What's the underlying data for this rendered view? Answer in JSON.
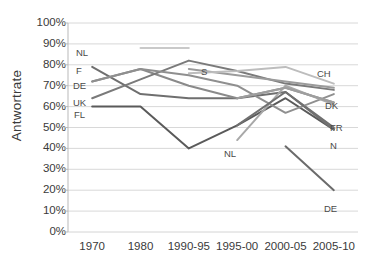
{
  "chart_data": {
    "type": "line",
    "title": "",
    "xlabel": "",
    "ylabel": "Antwortrate",
    "ylim": [
      0,
      100
    ],
    "grid": true,
    "legend": "inline-end-labels",
    "categories": [
      "1970",
      "1980",
      "1990-95",
      "1995-00",
      "2000-05",
      "2005-10"
    ],
    "ytick_labels": [
      "100%",
      "90%",
      "80%",
      "70%",
      "60%",
      "50%",
      "40%",
      "30%",
      "20%",
      "10%",
      "0%"
    ],
    "ytick_values": [
      100,
      90,
      80,
      70,
      60,
      50,
      40,
      30,
      20,
      10,
      0
    ],
    "series": [
      {
        "name": "NL",
        "label": "NL",
        "color": "#c9c9c9",
        "x": [
          "1980",
          "1990-95"
        ],
        "values": [
          88,
          88
        ]
      },
      {
        "name": "F",
        "label": "F",
        "color": "#6f6f6f",
        "x": [
          "1970",
          "1980",
          "1990-95",
          "1995-00",
          "2000-05",
          "2005-10"
        ],
        "values": [
          79,
          66,
          64,
          64,
          67,
          50
        ]
      },
      {
        "name": "DE",
        "label": "DE",
        "color": "#8a8a8a",
        "x": [
          "1970",
          "1980",
          "1990-95",
          "1995-00",
          "2000-05",
          "2005-10"
        ],
        "values": [
          72,
          78,
          70,
          64,
          69,
          62
        ]
      },
      {
        "name": "UK",
        "label": "UK",
        "color": "#7a7a7a",
        "x": [
          "1970",
          "1980",
          "1990-95",
          "1995-00",
          "2000-05",
          "2005-10"
        ],
        "values": [
          64,
          73,
          82,
          77,
          71,
          68
        ]
      },
      {
        "name": "FL",
        "label": "FL",
        "color": "#5a5a5a",
        "x": [
          "1970",
          "1980",
          "1990-95",
          "1995-00",
          "2000-05",
          "2005-10"
        ],
        "values": [
          60,
          60,
          40,
          51,
          64,
          49
        ]
      },
      {
        "name": "S",
        "label": "S",
        "color": "#9b9b9b",
        "x": [
          "1990-95",
          "1995-00",
          "2000-05",
          "2005-10"
        ],
        "values": [
          78,
          75,
          72,
          69
        ]
      },
      {
        "name": "CH",
        "label": "CH",
        "color": "#bdbdbd",
        "x": [
          "1990-95",
          "1995-00",
          "2000-05",
          "2005-10"
        ],
        "values": [
          76,
          77,
          79,
          71
        ]
      },
      {
        "name": "DK",
        "label": "DK",
        "color": "#8f8f8f",
        "x": [
          "1970",
          "1980",
          "1990-95",
          "1995-00",
          "2000-05",
          "2005-10"
        ],
        "values": [
          72,
          78,
          75,
          70,
          57,
          66
        ]
      },
      {
        "name": "NL-2",
        "label": "NL",
        "color": "#a8a8a8",
        "x": [
          "1995-00",
          "2000-05",
          "2005-10"
        ],
        "values": [
          44,
          70,
          61
        ]
      },
      {
        "name": "FR",
        "label": "FR",
        "color": "#9e9e9e",
        "x": [
          "1995-00",
          "2000-05",
          "2005-10"
        ],
        "values": [
          64,
          69,
          62
        ]
      },
      {
        "name": "N",
        "label": "N",
        "color": "#707070",
        "x": [
          "1995-00",
          "2000-05",
          "2005-10"
        ],
        "values": [
          51,
          67,
          49
        ]
      },
      {
        "name": "DE-2",
        "label": "DE",
        "color": "#6b6b6b",
        "x": [
          "2000-05",
          "2005-10"
        ],
        "values": [
          41,
          20
        ]
      }
    ],
    "inline_labels": [
      {
        "text": "NL",
        "x": 76,
        "y": 48
      },
      {
        "text": "F",
        "x": 76,
        "y": 66
      },
      {
        "text": "DE",
        "x": 73,
        "y": 81
      },
      {
        "text": "UK",
        "x": 73,
        "y": 98
      },
      {
        "text": "FL",
        "x": 74,
        "y": 110
      },
      {
        "text": "S",
        "x": 201,
        "y": 67
      },
      {
        "text": "CH",
        "x": 317,
        "y": 69
      },
      {
        "text": "DK",
        "x": 325,
        "y": 101
      },
      {
        "text": "FR",
        "x": 330,
        "y": 123
      },
      {
        "text": "N",
        "x": 330,
        "y": 141
      },
      {
        "text": "NL",
        "x": 224,
        "y": 149
      },
      {
        "text": "DE",
        "x": 324,
        "y": 204
      }
    ]
  },
  "axis": {
    "y_title": "Antwortrate",
    "y_ticks": [
      "100%",
      "90%",
      "80%",
      "70%",
      "60%",
      "50%",
      "40%",
      "30%",
      "20%",
      "10%",
      "0%"
    ],
    "x_ticks": [
      "1970",
      "1980",
      "1990-95",
      "1995-00",
      "2000-05",
      "2005-10"
    ]
  },
  "style": {
    "grid_color": "#d4d4d4",
    "text_color": "#3a3a3a",
    "background": "#ffffff"
  }
}
